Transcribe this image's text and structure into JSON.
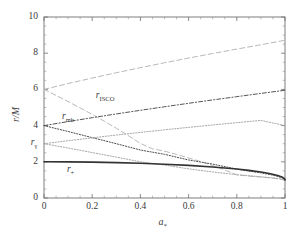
{
  "chart_data": {
    "type": "line",
    "title": "",
    "xlabel": "a*",
    "ylabel": "r/M",
    "xlim": [
      0,
      1
    ],
    "ylim": [
      0,
      10
    ],
    "grid": false,
    "legend": "inline-annotations",
    "xticks": [
      "0",
      "0.2",
      "0.4",
      "0.6",
      "0.8",
      "1"
    ],
    "xtick_values": [
      0,
      0.2,
      0.4,
      0.6,
      0.8,
      1
    ],
    "yticks": [
      "0",
      "2",
      "4",
      "6",
      "8",
      "10"
    ],
    "ytick_values": [
      0,
      2,
      4,
      6,
      8,
      10
    ],
    "annotations": [
      {
        "text": "r_ISCO",
        "base": "r",
        "sub": "ISCO",
        "x": 0.215,
        "y": 5.62
      },
      {
        "text": "r_mb",
        "base": "r",
        "sub": "mb",
        "x": 0.075,
        "y": 4.46
      },
      {
        "text": "r_gamma",
        "base": "r",
        "sub": "γ",
        "x": -0.055,
        "y": 3.03
      },
      {
        "text": "r_+",
        "base": "r",
        "sub": "+",
        "x": 0.095,
        "y": 1.52
      }
    ],
    "series": [
      {
        "name": "r_ISCO prograde",
        "style": "dashed",
        "color": "#b9b9b9",
        "width": 1.0,
        "x": [
          0,
          0.05,
          0.1,
          0.15,
          0.2,
          0.25,
          0.3,
          0.35,
          0.4,
          0.45,
          0.5,
          0.55,
          0.6,
          0.65,
          0.7,
          0.75,
          0.8,
          0.85,
          0.9,
          0.93,
          0.95,
          0.97,
          0.98,
          0.99,
          0.995,
          0.998,
          1
        ],
        "values": [
          6.0,
          5.669,
          5.329,
          4.979,
          4.617,
          4.243,
          3.853,
          3.446,
          3.015,
          2.719,
          2.587,
          2.406,
          2.215,
          2.011,
          1.792,
          1.551,
          1.278,
          1.212,
          1.158,
          1.123,
          1.095,
          1.06,
          1.04,
          1.015,
          1.008,
          1.004,
          1.0
        ]
      },
      {
        "name": "r_ISCO retrograde",
        "style": "dashed",
        "color": "#b9b9b9",
        "width": 1.0,
        "x": [
          0,
          0.1,
          0.2,
          0.3,
          0.4,
          0.5,
          0.6,
          0.7,
          0.8,
          0.9,
          1.0
        ],
        "values": [
          6.0,
          6.323,
          6.629,
          6.921,
          7.202,
          7.471,
          7.731,
          7.983,
          8.228,
          8.466,
          8.717
        ]
      },
      {
        "name": "r_mb prograde",
        "style": "dotted",
        "color": "#4d4d4d",
        "width": 1.0,
        "x": [
          0,
          0.1,
          0.2,
          0.3,
          0.4,
          0.5,
          0.6,
          0.7,
          0.8,
          0.85,
          0.9,
          0.94,
          0.97,
          0.99,
          1.0
        ],
        "values": [
          4.0,
          3.674,
          3.334,
          3.0,
          2.651,
          2.414,
          2.101,
          1.871,
          1.596,
          1.487,
          1.389,
          1.289,
          1.194,
          1.102,
          1.0
        ]
      },
      {
        "name": "r_mb retrograde",
        "style": "dashdot",
        "color": "#555555",
        "width": 1.0,
        "x": [
          0,
          0.1,
          0.2,
          0.3,
          0.4,
          0.5,
          0.6,
          0.7,
          0.8,
          0.9,
          1.0
        ],
        "values": [
          4.0,
          4.222,
          4.437,
          4.644,
          4.845,
          5.041,
          5.232,
          5.418,
          5.6,
          5.778,
          5.953
        ]
      },
      {
        "name": "r_gamma prograde",
        "style": "dotted",
        "color": "#a6a6a6",
        "width": 1.0,
        "x": [
          0,
          0.1,
          0.2,
          0.3,
          0.4,
          0.5,
          0.6,
          0.7,
          0.8,
          0.9,
          0.95,
          0.98,
          1.0
        ],
        "values": [
          3.0,
          2.76,
          2.51,
          2.26,
          2.0,
          1.82,
          1.61,
          1.44,
          1.29,
          1.17,
          1.11,
          1.06,
          1.0
        ]
      },
      {
        "name": "r_gamma retrograde",
        "style": "dotted",
        "color": "#a6a6a6",
        "width": 1.0,
        "x": [
          0,
          0.1,
          0.2,
          0.3,
          0.4,
          0.5,
          0.6,
          0.7,
          0.8,
          0.9,
          1.0
        ],
        "values": [
          3.0,
          3.165,
          3.324,
          3.477,
          3.624,
          3.766,
          3.903,
          4.035,
          4.162,
          4.286,
          4.0
        ]
      },
      {
        "name": "r_+ horizon",
        "style": "solid",
        "color": "#333333",
        "width": 1.6,
        "x": [
          0,
          0.1,
          0.2,
          0.3,
          0.4,
          0.5,
          0.6,
          0.7,
          0.8,
          0.85,
          0.9,
          0.94,
          0.97,
          0.99,
          0.998,
          1.0
        ],
        "values": [
          2.0,
          1.995,
          1.98,
          1.954,
          1.917,
          1.866,
          1.8,
          1.714,
          1.6,
          1.527,
          1.436,
          1.341,
          1.243,
          1.141,
          1.063,
          1.0
        ]
      }
    ]
  },
  "geometry": {
    "plot_left": 44,
    "plot_right": 285,
    "plot_top": 17,
    "plot_bottom": 198
  }
}
